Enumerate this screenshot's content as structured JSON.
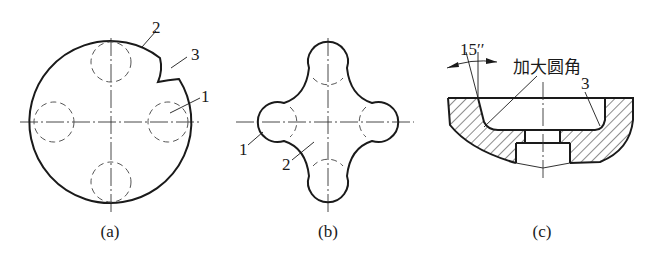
{
  "figure": {
    "panels": [
      {
        "id": "a",
        "caption": "(a)",
        "callouts": [
          "1",
          "2",
          "3"
        ],
        "description": "Circular blank with four hidden (dashed) circular lobes and a cutout defect"
      },
      {
        "id": "b",
        "caption": "(b)",
        "callouts": [
          "1",
          "2"
        ],
        "description": "Four-lobed cross-shaped blank"
      },
      {
        "id": "c",
        "caption": "(c)",
        "callouts": [
          "3"
        ],
        "angle_label": "15′′",
        "annotation": "加大圆角",
        "description": "Cross-section of die with hatched body and enlarged fillet"
      }
    ]
  }
}
